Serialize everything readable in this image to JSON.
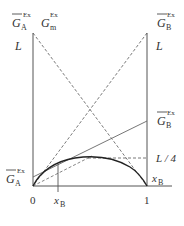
{
  "diagram": {
    "type": "excess-gibbs-energy-tangent-construction",
    "x_axis": {
      "tick_left": "0",
      "tick_right": "1",
      "marker": {
        "base": "x",
        "sub": "B"
      }
    },
    "labels": {
      "top_left": {
        "base": "G",
        "sub": "A",
        "sup": "Ex",
        "overbar": true
      },
      "top_middle": {
        "base": "G",
        "sub": "m",
        "sup": "Ex",
        "overbar": false
      },
      "top_right": {
        "base": "G",
        "sub": "B",
        "sup": "Ex",
        "overbar": true
      },
      "left_L": "L",
      "right_L": "L",
      "right_mid": {
        "base": "G",
        "sub": "B",
        "sup": "Ex",
        "overbar": true
      },
      "quarter": "L / 4",
      "left_bottom": {
        "base": "G",
        "sub": "A",
        "sup": "Ex",
        "overbar": true
      },
      "right_bottom_x": {
        "base": "x",
        "sub": "B"
      }
    },
    "colors": {
      "line": "#444444",
      "curve": "#222222",
      "text": "#333333"
    }
  }
}
